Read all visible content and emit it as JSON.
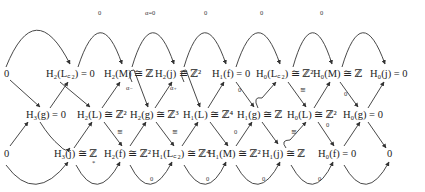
{
  "diagram": {
    "type": "long exact sequence braid diagram (homology)",
    "rows": {
      "top": [
        {
          "id": "t0",
          "text": "0",
          "x": 4,
          "y": 77
        },
        {
          "id": "t1",
          "text": "H₂(L꜀₂) = 0",
          "x": 48,
          "y": 77
        },
        {
          "id": "t2",
          "text": "H₂(M) ≅ ℤ",
          "x": 106,
          "y": 77
        },
        {
          "id": "t3",
          "text": "H₂(j) ≅ ℤ²",
          "x": 155,
          "y": 77
        },
        {
          "id": "t4",
          "text": "H₁(f) = 0",
          "x": 213,
          "y": 77
        },
        {
          "id": "t5",
          "text": "H₀(L꜀₂) ≅ ℤ²",
          "x": 258,
          "y": 77
        },
        {
          "id": "t6",
          "text": "H₀(M) ≅ ℤ",
          "x": 313,
          "y": 77
        },
        {
          "id": "t7",
          "text": "H₀(j) = 0",
          "x": 370,
          "y": 77
        }
      ],
      "middle": [
        {
          "id": "m1",
          "text": "H₃(g) = 0",
          "x": 27,
          "y": 118
        },
        {
          "id": "m2",
          "text": "H₂(L) ≅ ℤ²",
          "x": 78,
          "y": 118
        },
        {
          "id": "m3",
          "text": "H₂(g) ≅ ℤ³",
          "x": 131,
          "y": 118
        },
        {
          "id": "m4",
          "text": "H₁(L) ≅ ℤ⁴",
          "x": 184,
          "y": 118
        },
        {
          "id": "m5",
          "text": "H₁(g) ≅ ℤ",
          "x": 238,
          "y": 118
        },
        {
          "id": "m6",
          "text": "H₀(L) ≅ ℤ²",
          "x": 288,
          "y": 118
        },
        {
          "id": "m7",
          "text": "H₀(g) = 0",
          "x": 342,
          "y": 118
        }
      ],
      "bottom": [
        {
          "id": "b0",
          "text": "0",
          "x": 4,
          "y": 157
        },
        {
          "id": "b1",
          "text": "H₃(j) ≅ ℤ",
          "x": 54,
          "y": 157
        },
        {
          "id": "b2",
          "text": "H₂(f) ≅ ℤ²",
          "x": 104,
          "y": 157
        },
        {
          "id": "b3",
          "text": "H₁(L꜀₂) ≅ ℤ⁴",
          "x": 152,
          "y": 157
        },
        {
          "id": "b4",
          "text": "H₁(M) ≅ ℤ²",
          "x": 208,
          "y": 157
        },
        {
          "id": "b5",
          "text": "H₁(j) ≅ ℤ",
          "x": 262,
          "y": 157
        },
        {
          "id": "b6",
          "text": "H₀(f) = 0",
          "x": 318,
          "y": 157
        },
        {
          "id": "b7",
          "text": "0",
          "x": 386,
          "y": 157
        }
      ]
    },
    "arc_labels": {
      "top": [
        {
          "text": "0",
          "x": 98,
          "y": 15
        },
        {
          "text": "α=0",
          "x": 147,
          "y": 15
        },
        {
          "text": "0",
          "x": 204,
          "y": 15
        },
        {
          "text": "0",
          "x": 260,
          "y": 15
        },
        {
          "text": "0",
          "x": 320,
          "y": 15
        }
      ],
      "bottom": [
        {
          "text": "*",
          "x": 92,
          "y": 168
        },
        {
          "text": "0",
          "x": 150,
          "y": 181
        },
        {
          "text": "0",
          "x": 206,
          "y": 181
        },
        {
          "text": "0",
          "x": 262,
          "y": 181
        },
        {
          "text": "0",
          "x": 318,
          "y": 181
        }
      ],
      "diagonal": [
        {
          "text": "α₋",
          "x": 127,
          "y": 90
        },
        {
          "text": "α₊",
          "x": 170,
          "y": 90
        },
        {
          "text": "0",
          "x": 238,
          "y": 92
        },
        {
          "text": "≅",
          "x": 300,
          "y": 92
        },
        {
          "text": "0",
          "x": 346,
          "y": 96
        },
        {
          "text": "≅",
          "x": 117,
          "y": 134
        },
        {
          "text": "≅",
          "x": 172,
          "y": 134
        },
        {
          "text": "0",
          "x": 236,
          "y": 134
        },
        {
          "text": "≅",
          "x": 291,
          "y": 134
        },
        {
          "text": "0",
          "x": 327,
          "y": 117
        }
      ]
    }
  }
}
